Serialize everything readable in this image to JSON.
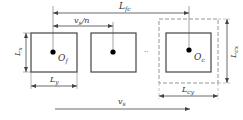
{
  "diagram": {
    "labels": {
      "L_fc": "L",
      "L_fc_sub": "fc",
      "vs_n": "v",
      "vs_n_sub": "s",
      "vs_n_tail": "/n",
      "Lx": "L",
      "Lx_sub": "x",
      "Ly": "L",
      "Ly_sub": "y",
      "Of": "O",
      "Of_sub": "f",
      "Oc": "O",
      "Oc_sub": "c",
      "Lcx": "L",
      "Lcx_sub": "cx",
      "Lcy": "L",
      "Lcy_sub": "cy",
      "vs": "v",
      "vs_sub": "s",
      "ellipsis": "··"
    },
    "colors": {
      "line": "#444444",
      "dashed": "#888888",
      "dot": "#000000"
    }
  }
}
